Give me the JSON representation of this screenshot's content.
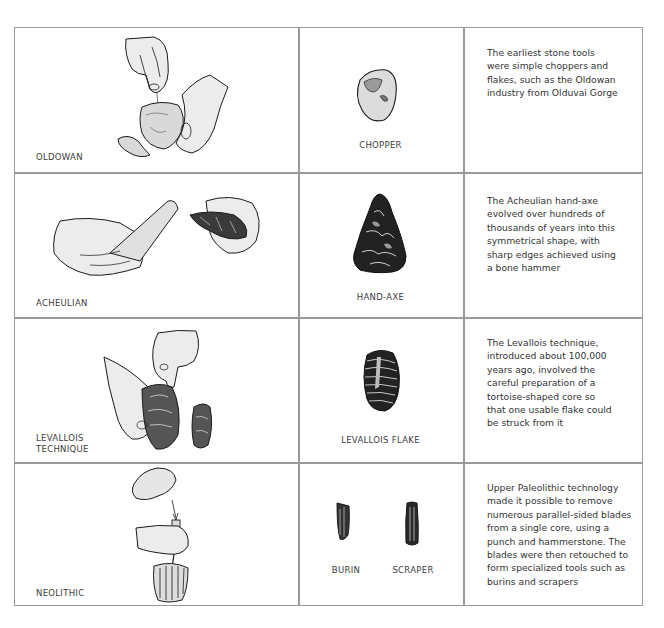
{
  "figure": {
    "rows": [
      {
        "technique": "OLDOWAN",
        "tools": [
          "CHOPPER"
        ],
        "description": [
          "The earliest stone tools",
          "were simple choppers and",
          "flakes, such as the Oldowan",
          "industry from Olduvai Gorge"
        ]
      },
      {
        "technique": "ACHEULIAN",
        "tools": [
          "HAND-AXE"
        ],
        "description": [
          "The Acheulian hand-axe",
          "evolved over hundreds of",
          "thousands of years into this",
          "symmetrical shape, with",
          "sharp edges achieved using",
          "a bone hammer"
        ]
      },
      {
        "technique_lines": [
          "LEVALLOIS",
          "TECHNIQUE"
        ],
        "tools": [
          "LEVALLOIS FLAKE"
        ],
        "description": [
          "The Levallois technique,",
          "introduced about 100,000",
          "years ago, involved the",
          "careful preparation of a",
          "tortoise-shaped core so",
          "that one usable flake could",
          "be struck from it"
        ]
      },
      {
        "technique": "NEOLITHIC",
        "tools": [
          "BURIN",
          "SCRAPER"
        ],
        "description": [
          "Upper Paleolithic technology",
          "made it possible to remove",
          "numerous parallel-sided blades",
          "from a single core, using a",
          "punch and hammerstone. The",
          "blades were then retouched to",
          "form specialized tools such as",
          "burins and scrapers"
        ]
      }
    ],
    "colors": {
      "border": "#9a9a9a",
      "text": "#3a3a3a",
      "ink": "#1a1a1a",
      "shade": "#e8e8e8"
    }
  }
}
